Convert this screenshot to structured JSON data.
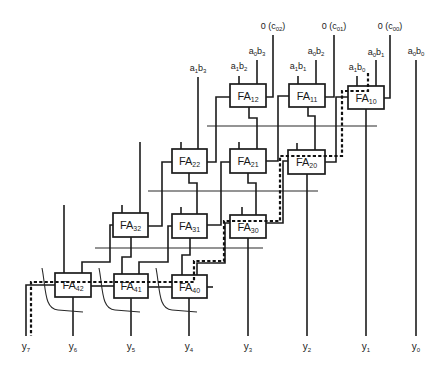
{
  "diagram": {
    "type": "carry-save array multiplier (full adder array)",
    "carry_inputs": [
      {
        "prefix": "0 (c",
        "sub": "02",
        "suffix": ")"
      },
      {
        "prefix": "0 (c",
        "sub": "01",
        "suffix": ")"
      },
      {
        "prefix": "0 (c",
        "sub": "00",
        "suffix": ")"
      }
    ],
    "partial_products": [
      {
        "v1": "a",
        "s1": "0",
        "v2": "b",
        "s2": "3"
      },
      {
        "v1": "a",
        "s1": "0",
        "v2": "b",
        "s2": "2"
      },
      {
        "v1": "a",
        "s1": "0",
        "v2": "b",
        "s2": "1"
      },
      {
        "v1": "a",
        "s1": "0",
        "v2": "b",
        "s2": "0"
      },
      {
        "v1": "a",
        "s1": "1",
        "v2": "b",
        "s2": "3"
      },
      {
        "v1": "a",
        "s1": "1",
        "v2": "b",
        "s2": "2"
      },
      {
        "v1": "a",
        "s1": "1",
        "v2": "b",
        "s2": "1"
      },
      {
        "v1": "a",
        "s1": "1",
        "v2": "b",
        "s2": "0"
      }
    ],
    "adders": [
      {
        "name": "FA",
        "sub": "12"
      },
      {
        "name": "FA",
        "sub": "11"
      },
      {
        "name": "FA",
        "sub": "10"
      },
      {
        "name": "FA",
        "sub": "22"
      },
      {
        "name": "FA",
        "sub": "21"
      },
      {
        "name": "FA",
        "sub": "20"
      },
      {
        "name": "FA",
        "sub": "32"
      },
      {
        "name": "FA",
        "sub": "31"
      },
      {
        "name": "FA",
        "sub": "30"
      },
      {
        "name": "FA",
        "sub": "42"
      },
      {
        "name": "FA",
        "sub": "41"
      },
      {
        "name": "FA",
        "sub": "40"
      }
    ],
    "outputs": [
      {
        "name": "y",
        "sub": "7"
      },
      {
        "name": "y",
        "sub": "6"
      },
      {
        "name": "y",
        "sub": "5"
      },
      {
        "name": "y",
        "sub": "4"
      },
      {
        "name": "y",
        "sub": "3"
      },
      {
        "name": "y",
        "sub": "2"
      },
      {
        "name": "y",
        "sub": "1"
      },
      {
        "name": "y",
        "sub": "0"
      }
    ],
    "critical_path_style": "dashed",
    "colors": {
      "line": "#1c1c1c",
      "background": "#ffffff"
    }
  }
}
